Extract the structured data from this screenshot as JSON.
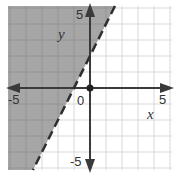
{
  "chart_data": {
    "type": "inequality-graph",
    "title": "",
    "xlabel": "x",
    "ylabel": "y",
    "xlim": [
      -5,
      5
    ],
    "ylim": [
      -5,
      5
    ],
    "grid": true,
    "grid_step": 1,
    "tick_labels": {
      "x_min": "-5",
      "x_max": "5",
      "y_min": "-5",
      "y_max": "5",
      "origin": "0"
    },
    "boundary_line": {
      "equation": "y = 2x + 2",
      "slope": 2,
      "intercept": 2,
      "style": "dashed",
      "points": [
        [
          -3.5,
          -5
        ],
        [
          1.5,
          5
        ]
      ]
    },
    "shaded_region": "left/above boundary",
    "inequality": "y > 2x + 2",
    "marked_point": [
      0,
      0
    ],
    "colors": {
      "shade": "#a6a6a6",
      "grid": "#d9d9d9",
      "grid_on_shade": "#949494",
      "axis": "#3a3a3a",
      "boundary": "#2e2e2e"
    }
  }
}
